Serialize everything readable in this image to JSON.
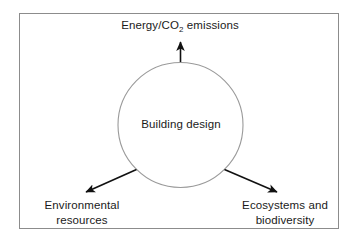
{
  "figure": {
    "type": "concept-diagram",
    "center_node": {
      "label": "Building design",
      "shape": "circle",
      "stroke_color": "#9a9a9a"
    },
    "outcomes": [
      {
        "id": "energy-co2-emissions",
        "label_prefix": "Energy/CO",
        "label_subscript": "2",
        "label_suffix": " emissions",
        "full_label": "Energy/CO2 emissions",
        "direction": "up"
      },
      {
        "id": "environmental-resources",
        "line1": "Environmental",
        "line2": "resources",
        "full_label": "Environmental resources",
        "direction": "down-left"
      },
      {
        "id": "ecosystems-and-biodiversity",
        "line1": "Ecosystems and",
        "line2": "biodiversity",
        "full_label": "Ecosystems and biodiversity",
        "direction": "down-right"
      }
    ],
    "arrow_color": "#111111",
    "frame_color": "#8c8c8c",
    "background_color": "#ffffff",
    "text_color": "#1a1a1a"
  }
}
